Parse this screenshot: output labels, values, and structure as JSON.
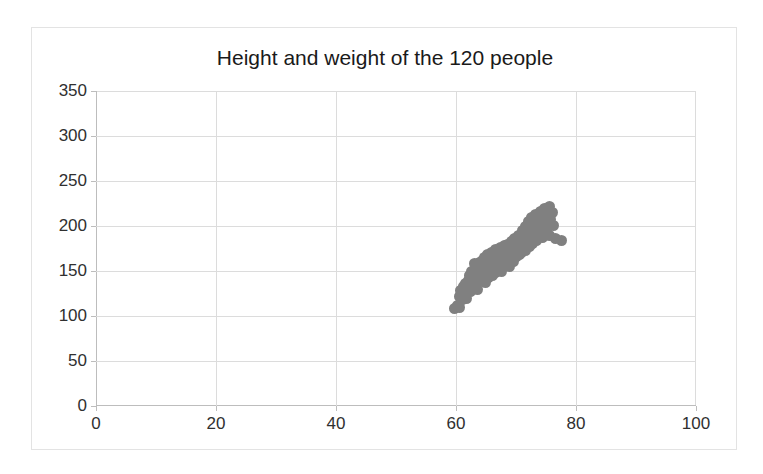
{
  "chart_data": {
    "type": "scatter",
    "title": "Height and weight of the 120 people",
    "xlabel": "",
    "ylabel": "",
    "xlim": [
      0,
      100
    ],
    "ylim": [
      0,
      350
    ],
    "xticks": [
      0,
      20,
      40,
      60,
      80,
      100
    ],
    "yticks": [
      0,
      50,
      100,
      150,
      200,
      250,
      300,
      350
    ],
    "grid": true,
    "legend": false,
    "marker_color": "#808080",
    "marker_size": 11,
    "n_points": 120,
    "series": [
      {
        "name": "people",
        "x": [
          59.8,
          60.2,
          60.5,
          60.6,
          60.8,
          61.0,
          61.1,
          61.2,
          61.3,
          61.5,
          61.6,
          61.8,
          62.0,
          62.1,
          62.2,
          62.4,
          62.5,
          62.6,
          62.8,
          63.0,
          63.1,
          63.2,
          63.3,
          63.5,
          63.6,
          63.8,
          63.9,
          64.0,
          64.1,
          64.3,
          64.4,
          64.5,
          64.6,
          64.8,
          64.9,
          65.0,
          65.1,
          65.2,
          65.4,
          65.5,
          65.6,
          65.8,
          65.9,
          66.0,
          66.1,
          66.2,
          66.4,
          66.5,
          66.6,
          66.8,
          66.9,
          67.0,
          67.1,
          67.2,
          67.4,
          67.5,
          67.6,
          67.8,
          67.9,
          68.0,
          68.1,
          68.2,
          68.4,
          68.5,
          68.6,
          68.8,
          68.9,
          69.0,
          69.1,
          69.2,
          69.4,
          69.5,
          69.6,
          69.8,
          69.9,
          70.0,
          70.1,
          70.2,
          70.4,
          70.5,
          70.6,
          70.8,
          70.9,
          71.0,
          71.1,
          71.2,
          71.4,
          71.5,
          71.6,
          71.8,
          72.0,
          72.1,
          72.2,
          72.4,
          72.5,
          72.6,
          72.8,
          73.0,
          73.1,
          73.2,
          73.4,
          73.5,
          73.6,
          73.8,
          74.0,
          74.2,
          74.4,
          74.5,
          74.6,
          74.8,
          75.0,
          75.2,
          75.4,
          75.5,
          75.6,
          75.8,
          76.0,
          76.2,
          76.5,
          77.5
        ],
        "y": [
          108,
          112,
          110,
          122,
          128,
          130,
          118,
          126,
          133,
          124,
          136,
          119,
          140,
          131,
          145,
          127,
          138,
          150,
          134,
          158,
          142,
          148,
          136,
          152,
          129,
          144,
          160,
          139,
          155,
          147,
          162,
          141,
          151,
          165,
          137,
          156,
          146,
          168,
          143,
          159,
          149,
          153,
          171,
          157,
          145,
          163,
          152,
          174,
          148,
          166,
          158,
          154,
          169,
          161,
          176,
          150,
          164,
          172,
          156,
          167,
          178,
          159,
          173,
          162,
          180,
          168,
          155,
          175,
          165,
          183,
          170,
          161,
          177,
          186,
          172,
          166,
          181,
          174,
          190,
          168,
          179,
          185,
          171,
          195,
          176,
          188,
          180,
          200,
          173,
          192,
          183,
          205,
          177,
          197,
          186,
          210,
          181,
          202,
          190,
          213,
          184,
          196,
          206,
          191,
          216,
          200,
          187,
          209,
          194,
          219,
          203,
          198,
          212,
          222,
          190,
          207,
          215,
          201,
          186,
          184
        ]
      }
    ]
  },
  "axis": {
    "y_tick_labels": [
      "350",
      "300",
      "250",
      "200",
      "150",
      "100",
      "50",
      "0"
    ],
    "x_tick_labels": [
      "0",
      "20",
      "40",
      "60",
      "80",
      "100"
    ]
  }
}
